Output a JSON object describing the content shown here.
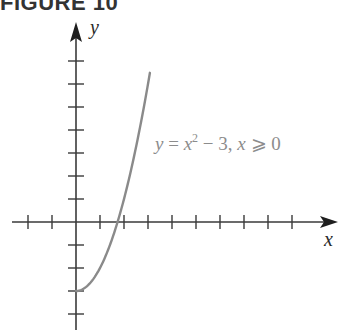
{
  "figure": {
    "title": "FIGURE 10"
  },
  "chart_data": {
    "type": "line",
    "title": "FIGURE 10",
    "xlabel": "x",
    "ylabel": "y",
    "xlim": [
      -2.7,
      10.8
    ],
    "ylim": [
      -4.7,
      8.5
    ],
    "grid": false,
    "x_ticks": [
      -2,
      -1,
      1,
      2,
      3,
      4,
      5,
      6,
      7,
      8,
      9
    ],
    "y_ticks": [
      -4,
      -3,
      -2,
      -1,
      1,
      2,
      3,
      4,
      5,
      6,
      7
    ],
    "tick_labels_shown": false,
    "series": [
      {
        "name": "y = x^2 - 3, x >= 0",
        "function": "x^2 - 3",
        "domain": [
          0,
          3.08
        ],
        "x": [
          0,
          0.5,
          1,
          1.5,
          1.732,
          2,
          2.5,
          3,
          3.08
        ],
        "y": [
          -3,
          -2.75,
          -2,
          -0.75,
          0,
          1,
          3.25,
          6,
          6.49
        ],
        "color": "#8a8a8a"
      }
    ],
    "annotations": [
      {
        "text": "y = x² − 3, x ⩾ 0",
        "position": "right of curve, above x-axis"
      }
    ]
  },
  "labels": {
    "x_axis": "x",
    "y_axis": "y",
    "eq_y": "y",
    "eq_equals": " = ",
    "eq_x": "x",
    "eq_exp": "2",
    "eq_rest": " − 3, ",
    "eq_x2": "x",
    "eq_cond": " ⩾ 0"
  },
  "colors": {
    "axis": "#3a3a3a",
    "curve": "#8a8a8a",
    "label": "#8c8c8c"
  }
}
